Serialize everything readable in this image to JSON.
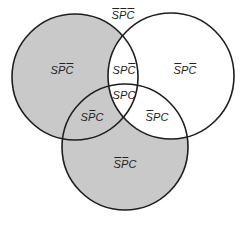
{
  "diagram": {
    "type": "venn-3",
    "sets": [
      {
        "id": "S",
        "cx": 75,
        "cy": 77,
        "r": 63
      },
      {
        "id": "P",
        "cx": 171,
        "cy": 76,
        "r": 63
      },
      {
        "id": "C",
        "cx": 125,
        "cy": 147,
        "r": 63
      }
    ],
    "colors": {
      "shade": "#c9c9c9",
      "stroke": "#1e1e1e",
      "background": "#ffffff"
    },
    "shaded_regions": [
      "S-only",
      "S-and-C-only",
      "C-only"
    ],
    "regions": [
      {
        "id": "outside",
        "label": "S̄P̄C̄",
        "letters": [
          {
            "c": "S",
            "bar": true
          },
          {
            "c": "P",
            "bar": true
          },
          {
            "c": "C",
            "bar": true
          }
        ],
        "x": 123,
        "y": 15,
        "shaded": false
      },
      {
        "id": "S-only",
        "label": "SP̄C̄",
        "letters": [
          {
            "c": "S",
            "bar": false
          },
          {
            "c": "P",
            "bar": true
          },
          {
            "c": "C",
            "bar": true
          }
        ],
        "x": 62,
        "y": 70,
        "shaded": true
      },
      {
        "id": "S-and-P-only",
        "label": "SPC̄",
        "letters": [
          {
            "c": "S",
            "bar": false
          },
          {
            "c": "P",
            "bar": false
          },
          {
            "c": "C",
            "bar": true
          }
        ],
        "x": 124,
        "y": 70,
        "shaded": false
      },
      {
        "id": "P-only",
        "label": "S̄PC̄",
        "letters": [
          {
            "c": "S",
            "bar": true
          },
          {
            "c": "P",
            "bar": false
          },
          {
            "c": "C",
            "bar": true
          }
        ],
        "x": 185,
        "y": 70,
        "shaded": false
      },
      {
        "id": "all-three",
        "label": "SPC",
        "letters": [
          {
            "c": "S",
            "bar": false
          },
          {
            "c": "P",
            "bar": false
          },
          {
            "c": "C",
            "bar": false
          }
        ],
        "x": 124,
        "y": 95,
        "shaded": false
      },
      {
        "id": "S-and-C-only",
        "label": "SP̄C",
        "letters": [
          {
            "c": "S",
            "bar": false
          },
          {
            "c": "P",
            "bar": true
          },
          {
            "c": "C",
            "bar": false
          }
        ],
        "x": 92,
        "y": 117,
        "shaded": true
      },
      {
        "id": "P-and-C-only",
        "label": "S̄PC",
        "letters": [
          {
            "c": "S",
            "bar": true
          },
          {
            "c": "P",
            "bar": false
          },
          {
            "c": "C",
            "bar": false
          }
        ],
        "x": 157,
        "y": 117,
        "shaded": false
      },
      {
        "id": "C-only",
        "label": "S̄P̄C",
        "letters": [
          {
            "c": "S",
            "bar": true
          },
          {
            "c": "P",
            "bar": true
          },
          {
            "c": "C",
            "bar": false
          }
        ],
        "x": 125,
        "y": 164,
        "shaded": true
      }
    ]
  }
}
